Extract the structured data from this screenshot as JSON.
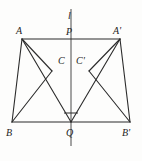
{
  "figure": {
    "kind": "geometry-diagram",
    "width": 142,
    "height": 161,
    "background_color": "#fdfdfc",
    "stroke_color": "#2b2b2b",
    "label_color": "#1d1d1d",
    "axis_line_color": "#4a4a4a",
    "stroke_width": 1.1
  },
  "points": {
    "A": {
      "label": "A",
      "x": 22,
      "y": 39,
      "label_x": 16,
      "label_y": 26
    },
    "Aq": {
      "label": "A'",
      "x": 120,
      "y": 39,
      "label_x": 114,
      "label_y": 26
    },
    "B": {
      "label": "B",
      "x": 12,
      "y": 122,
      "label_x": 7,
      "label_y": 129
    },
    "Bq": {
      "label": "B'",
      "x": 130,
      "y": 122,
      "label_x": 124,
      "label_y": 129
    },
    "C": {
      "label": "C",
      "x": 52,
      "y": 71,
      "label_x": 58,
      "label_y": 57
    },
    "Cq": {
      "label": "C'",
      "x": 89,
      "y": 71,
      "label_x": 77,
      "label_y": 57
    },
    "P": {
      "label": "P",
      "x": 71,
      "y": 39,
      "label_x": 66,
      "label_y": 28
    },
    "Q": {
      "label": "Q",
      "x": 71,
      "y": 122,
      "label_x": 66,
      "label_y": 129
    }
  },
  "line_label": {
    "label": "l",
    "x": 71,
    "y": 14,
    "label_x": 69,
    "label_y": 12
  },
  "axis_line": {
    "x": 71,
    "y_top": 9,
    "y_bottom": 146
  },
  "segments": [
    {
      "name": "segment-A-Aprime",
      "x1": 22,
      "y1": 39,
      "x2": 120,
      "y2": 39
    },
    {
      "name": "segment-B-Bprime",
      "x1": 12,
      "y1": 122,
      "x2": 130,
      "y2": 122
    },
    {
      "name": "segment-A-B",
      "x1": 22,
      "y1": 39,
      "x2": 12,
      "y2": 122
    },
    {
      "name": "segment-Aprime-Bprime",
      "x1": 120,
      "y1": 39,
      "x2": 130,
      "y2": 122
    },
    {
      "name": "segment-A-Q",
      "x1": 22,
      "y1": 39,
      "x2": 71,
      "y2": 122
    },
    {
      "name": "segment-Aprime-Q",
      "x1": 120,
      "y1": 39,
      "x2": 71,
      "y2": 122
    },
    {
      "name": "segment-A-C",
      "x1": 22,
      "y1": 39,
      "x2": 52,
      "y2": 71
    },
    {
      "name": "segment-Aprime-Cprime",
      "x1": 120,
      "y1": 39,
      "x2": 89,
      "y2": 71
    },
    {
      "name": "segment-C-B",
      "x1": 52,
      "y1": 71,
      "x2": 12,
      "y2": 122
    },
    {
      "name": "segment-Cprime-Bprime",
      "x1": 89,
      "y1": 71,
      "x2": 130,
      "y2": 122
    }
  ],
  "angle_marker": {
    "name": "right-angle-marker-at-Q",
    "x1": 64,
    "y1": 113,
    "x2": 78,
    "y2": 113
  }
}
